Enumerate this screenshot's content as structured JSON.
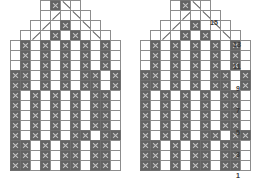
{
  "chart_title": "",
  "chart_data": {
    "type": "heatmap",
    "xlabel": "",
    "ylabel": "Row",
    "grid": true,
    "legend": [],
    "cell_px": 11,
    "symbols": {
      "fill": "contrast colour stitch (filled square with x)",
      "empty": "background colour stitch (empty square)",
      "dl": "left-leaning decrease (/)",
      "dr": "right-leaning decrease (\\)",
      "blank": "no stitch"
    },
    "row_labels": [
      "1",
      "3",
      "5",
      "7",
      "9",
      "11",
      "13",
      "15"
    ],
    "row_label_rows": [
      1,
      3,
      5,
      7,
      9,
      11,
      13,
      15
    ],
    "rows_total": 17,
    "cols_total": 11,
    "charts": [
      {
        "name": "left-chart",
        "rows": [
          {
            "row": 17,
            "cells": [
              "blank",
              "blank",
              "blank",
              "empty",
              "fill",
              "dr",
              "empty",
              "blank",
              "blank",
              "blank",
              "blank"
            ]
          },
          {
            "row": 16,
            "cells": [
              "blank",
              "blank",
              "blank",
              "empty",
              "dl",
              "empty",
              "dr",
              "empty",
              "blank",
              "blank",
              "blank"
            ]
          },
          {
            "row": 15,
            "cells": [
              "blank",
              "blank",
              "empty",
              "dl",
              "empty",
              "fill",
              "empty",
              "dr",
              "empty",
              "blank",
              "blank"
            ]
          },
          {
            "row": 14,
            "cells": [
              "blank",
              "empty",
              "dl",
              "empty",
              "fill",
              "empty",
              "fill",
              "empty",
              "dr",
              "empty",
              "blank"
            ]
          },
          {
            "row": 13,
            "cells": [
              "empty",
              "fill",
              "empty",
              "fill",
              "empty",
              "fill",
              "empty",
              "fill",
              "empty",
              "fill",
              "empty"
            ]
          },
          {
            "row": 12,
            "cells": [
              "empty",
              "fill",
              "empty",
              "fill",
              "empty",
              "fill",
              "empty",
              "fill",
              "empty",
              "fill",
              "empty"
            ]
          },
          {
            "row": 11,
            "cells": [
              "empty",
              "fill",
              "empty",
              "fill",
              "empty",
              "fill",
              "empty",
              "fill",
              "empty",
              "fill",
              "empty"
            ]
          },
          {
            "row": 10,
            "cells": [
              "fill",
              "fill",
              "empty",
              "fill",
              "empty",
              "fill",
              "empty",
              "fill",
              "fill",
              "empty",
              "fill"
            ]
          },
          {
            "row": 9,
            "cells": [
              "fill",
              "fill",
              "empty",
              "fill",
              "empty",
              "fill",
              "empty",
              "fill",
              "fill",
              "empty",
              "fill"
            ]
          },
          {
            "row": 8,
            "cells": [
              "fill",
              "empty",
              "fill",
              "empty",
              "fill",
              "empty",
              "fill",
              "empty",
              "fill",
              "fill",
              "empty"
            ]
          },
          {
            "row": 7,
            "cells": [
              "fill",
              "empty",
              "fill",
              "empty",
              "fill",
              "empty",
              "fill",
              "empty",
              "fill",
              "fill",
              "empty"
            ]
          },
          {
            "row": 6,
            "cells": [
              "fill",
              "empty",
              "fill",
              "empty",
              "fill",
              "empty",
              "fill",
              "empty",
              "fill",
              "fill",
              "empty"
            ]
          },
          {
            "row": 5,
            "cells": [
              "fill",
              "empty",
              "fill",
              "empty",
              "fill",
              "empty",
              "fill",
              "empty",
              "fill",
              "fill",
              "empty"
            ]
          },
          {
            "row": 4,
            "cells": [
              "fill",
              "empty",
              "fill",
              "empty",
              "fill",
              "empty",
              "fill",
              "fill",
              "empty",
              "fill",
              "fill"
            ]
          },
          {
            "row": 3,
            "cells": [
              "fill",
              "fill",
              "empty",
              "fill",
              "empty",
              "fill",
              "fill",
              "empty",
              "fill",
              "fill",
              "empty"
            ]
          },
          {
            "row": 2,
            "cells": [
              "fill",
              "fill",
              "empty",
              "fill",
              "empty",
              "fill",
              "fill",
              "empty",
              "fill",
              "fill",
              "empty"
            ]
          },
          {
            "row": 1,
            "cells": [
              "fill",
              "fill",
              "empty",
              "fill",
              "empty",
              "fill",
              "fill",
              "empty",
              "fill",
              "fill",
              "empty"
            ]
          }
        ]
      },
      {
        "name": "right-chart",
        "rows": [
          {
            "row": 17,
            "cells": [
              "blank",
              "blank",
              "blank",
              "empty",
              "fill",
              "dr",
              "empty",
              "blank",
              "blank",
              "blank",
              "blank"
            ]
          },
          {
            "row": 16,
            "cells": [
              "blank",
              "blank",
              "blank",
              "empty",
              "dl",
              "empty",
              "dr",
              "empty",
              "blank",
              "blank",
              "blank"
            ]
          },
          {
            "row": 15,
            "cells": [
              "blank",
              "blank",
              "empty",
              "dl",
              "empty",
              "fill",
              "empty",
              "dr",
              "empty",
              "blank",
              "blank"
            ]
          },
          {
            "row": 14,
            "cells": [
              "blank",
              "empty",
              "dl",
              "empty",
              "fill",
              "empty",
              "fill",
              "empty",
              "dr",
              "empty",
              "blank"
            ]
          },
          {
            "row": 13,
            "cells": [
              "empty",
              "fill",
              "empty",
              "fill",
              "empty",
              "fill",
              "empty",
              "fill",
              "empty",
              "fill",
              "empty"
            ]
          },
          {
            "row": 12,
            "cells": [
              "empty",
              "fill",
              "empty",
              "fill",
              "empty",
              "fill",
              "empty",
              "fill",
              "empty",
              "fill",
              "empty"
            ]
          },
          {
            "row": 11,
            "cells": [
              "empty",
              "fill",
              "empty",
              "fill",
              "empty",
              "fill",
              "empty",
              "fill",
              "empty",
              "fill",
              "empty"
            ]
          },
          {
            "row": 10,
            "cells": [
              "fill",
              "fill",
              "empty",
              "fill",
              "empty",
              "fill",
              "empty",
              "fill",
              "fill",
              "empty",
              "fill"
            ]
          },
          {
            "row": 9,
            "cells": [
              "fill",
              "fill",
              "empty",
              "fill",
              "empty",
              "fill",
              "empty",
              "fill",
              "fill",
              "empty",
              "fill"
            ]
          },
          {
            "row": 8,
            "cells": [
              "fill",
              "empty",
              "fill",
              "empty",
              "fill",
              "empty",
              "fill",
              "empty",
              "fill",
              "fill",
              "empty"
            ]
          },
          {
            "row": 7,
            "cells": [
              "fill",
              "empty",
              "fill",
              "empty",
              "fill",
              "empty",
              "fill",
              "empty",
              "fill",
              "fill",
              "empty"
            ]
          },
          {
            "row": 6,
            "cells": [
              "fill",
              "empty",
              "fill",
              "empty",
              "fill",
              "empty",
              "fill",
              "empty",
              "fill",
              "fill",
              "empty"
            ]
          },
          {
            "row": 5,
            "cells": [
              "fill",
              "empty",
              "fill",
              "empty",
              "fill",
              "empty",
              "fill",
              "empty",
              "fill",
              "fill",
              "empty"
            ]
          },
          {
            "row": 4,
            "cells": [
              "fill",
              "empty",
              "fill",
              "empty",
              "fill",
              "empty",
              "fill",
              "fill",
              "empty",
              "fill",
              "fill"
            ]
          },
          {
            "row": 3,
            "cells": [
              "fill",
              "fill",
              "empty",
              "fill",
              "empty",
              "fill",
              "fill",
              "empty",
              "fill",
              "fill",
              "empty"
            ]
          },
          {
            "row": 2,
            "cells": [
              "fill",
              "fill",
              "empty",
              "fill",
              "empty",
              "fill",
              "fill",
              "empty",
              "fill",
              "fill",
              "empty"
            ]
          },
          {
            "row": 1,
            "cells": [
              "fill",
              "fill",
              "empty",
              "fill",
              "empty",
              "fill",
              "fill",
              "empty",
              "fill",
              "fill",
              "empty"
            ]
          }
        ]
      }
    ],
    "colors": {
      "fill": "#636363",
      "empty": "#ffffff",
      "grid": "#8d8d8d",
      "symbol": "#5d5d5d",
      "label": "#3a3a3a",
      "background": "#ffffff"
    }
  },
  "labels": [
    {
      "text": "15",
      "x": 210,
      "y": 19
    },
    {
      "text": "13",
      "x": 233,
      "y": 41
    },
    {
      "text": "11",
      "x": 233,
      "y": 63
    },
    {
      "text": "9",
      "x": 236,
      "y": 85
    },
    {
      "text": "7",
      "x": 236,
      "y": 107
    },
    {
      "text": "5",
      "x": 236,
      "y": 129
    },
    {
      "text": "3",
      "x": 236,
      "y": 151
    },
    {
      "text": "1",
      "x": 236,
      "y": 172
    }
  ]
}
